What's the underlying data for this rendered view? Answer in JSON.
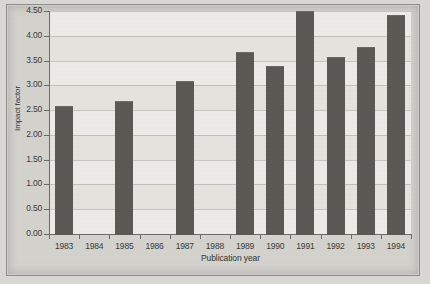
{
  "chart_data": {
    "type": "bar",
    "title": "",
    "subtitle": "",
    "xlabel": "Publication year",
    "ylabel": "Impact factor",
    "categories": [
      "1983",
      "1984",
      "1985",
      "1986",
      "1987",
      "1988",
      "1989",
      "1990",
      "1991",
      "1992",
      "1993",
      "1994"
    ],
    "values": [
      2.58,
      null,
      2.68,
      null,
      3.08,
      null,
      3.68,
      3.4,
      4.5,
      3.57,
      3.77,
      4.42
    ],
    "ylim": [
      0.0,
      4.5
    ],
    "ytick_labels": [
      "0.00",
      "0.50",
      "1.00",
      "1.50",
      "2.00",
      "2.50",
      "3.00",
      "3.50",
      "4.00",
      "4.50"
    ],
    "ytick_values": [
      0.0,
      0.5,
      1.0,
      1.5,
      2.0,
      2.5,
      3.0,
      3.5,
      4.0,
      4.5
    ],
    "grid": "horizontal",
    "legend": "none",
    "bar_color": "#595853",
    "plot_background": "#e4e3de",
    "page_background": "#d3d2cd",
    "missing_categories": [
      "1984",
      "1986",
      "1988"
    ]
  }
}
